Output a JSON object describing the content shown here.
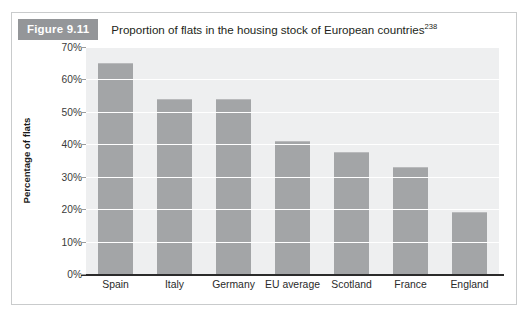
{
  "figure": {
    "badge_label": "Figure 9.11",
    "caption": "Proportion of flats in the housing stock of European countries",
    "caption_superscript": "238"
  },
  "colors": {
    "badge_bg": "#949699",
    "badge_text": "#ffffff",
    "bar_fill": "#a3a5a7",
    "plot_bg": "#eeeff0",
    "gridline": "#ffffff",
    "axis_line": "#2b2b2b",
    "frame_border": "#c9cbcc",
    "page_bg": "#ffffff"
  },
  "chart_data": {
    "type": "bar",
    "title": "Proportion of flats in the housing stock of European countries",
    "xlabel": "",
    "ylabel": "Percentage of flats",
    "categories": [
      "Spain",
      "Italy",
      "Germany",
      "EU average",
      "Scotland",
      "France",
      "England"
    ],
    "values": [
      65,
      54,
      54,
      41,
      37.5,
      33,
      19
    ],
    "value_labels": [
      "65%",
      "54%",
      "54%",
      "41%",
      "37.5%",
      "33%",
      "19%"
    ],
    "ylim": [
      0,
      70
    ],
    "ytick_values": [
      0,
      10,
      20,
      30,
      40,
      50,
      60,
      70
    ],
    "ytick_labels": [
      "0%",
      "10%",
      "20%",
      "30%",
      "40%",
      "50%",
      "60%",
      "70%"
    ],
    "grid": true,
    "grid_axis": "y",
    "legend": false,
    "legend_position": "none",
    "series": [
      {
        "name": "Percentage of flats",
        "values": [
          65,
          54,
          54,
          41,
          37.5,
          33,
          19
        ]
      }
    ]
  }
}
